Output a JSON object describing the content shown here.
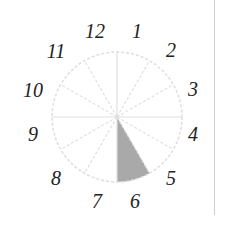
{
  "diagram": {
    "type": "clock-face",
    "center": [
      117,
      117
    ],
    "radius": 65,
    "label_radius": 82,
    "divisions": 12,
    "circle_color": "#dedede",
    "line_color": "#e0e0e0",
    "shaded_sector": {
      "from_hour": 5,
      "to_hour": 6,
      "color": "#a9a9a9"
    },
    "labels": [
      {
        "text": "12",
        "x": 95,
        "y": 38
      },
      {
        "text": "1",
        "x": 137,
        "y": 38
      },
      {
        "text": "2",
        "x": 171,
        "y": 57
      },
      {
        "text": "3",
        "x": 193,
        "y": 96
      },
      {
        "text": "4",
        "x": 193,
        "y": 141
      },
      {
        "text": "5",
        "x": 171,
        "y": 185
      },
      {
        "text": "6",
        "x": 135,
        "y": 208
      },
      {
        "text": "7",
        "x": 97,
        "y": 208
      },
      {
        "text": "8",
        "x": 56,
        "y": 185
      },
      {
        "text": "9",
        "x": 33,
        "y": 141
      },
      {
        "text": "10",
        "x": 33,
        "y": 97
      },
      {
        "text": "11",
        "x": 56,
        "y": 58
      }
    ]
  }
}
